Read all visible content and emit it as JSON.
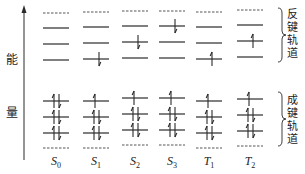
{
  "axis": {
    "label_top": "能",
    "label_bottom": "量",
    "direction": "up"
  },
  "groups": {
    "antibonding": "反键轨道",
    "bonding": "成键轨道"
  },
  "states": [
    {
      "name": "S",
      "sub": "0"
    },
    {
      "name": "S",
      "sub": "1"
    },
    {
      "name": "S",
      "sub": "2"
    },
    {
      "name": "S",
      "sub": "3"
    },
    {
      "name": "T",
      "sub": "1"
    },
    {
      "name": "T",
      "sub": "2"
    }
  ],
  "chart_data": {
    "type": "energy-level-diagram",
    "title": "",
    "ylabel": "能量",
    "columns": [
      "S0",
      "S1",
      "S2",
      "S3",
      "T1",
      "T2"
    ],
    "antibonding_orbitals_low_to_high": {
      "S0": [
        "",
        "",
        ""
      ],
      "S1": [
        "down",
        "",
        ""
      ],
      "S2": [
        "",
        "down",
        ""
      ],
      "S3": [
        "",
        "",
        "down"
      ],
      "T1": [
        "up",
        "",
        ""
      ],
      "T2": [
        "",
        "up",
        ""
      ]
    },
    "bonding_orbitals_low_to_high": {
      "S0": [
        "updown",
        "updown",
        "updown"
      ],
      "S1": [
        "updown",
        "updown",
        "up"
      ],
      "S2": [
        "updown",
        "updown",
        "up"
      ],
      "S3": [
        "updown",
        "updown",
        "up"
      ],
      "T1": [
        "updown",
        "updown",
        "up"
      ],
      "T2": [
        "updown",
        "updown",
        "up"
      ]
    },
    "group_labels": [
      "反键轨道",
      "成键轨道"
    ]
  }
}
